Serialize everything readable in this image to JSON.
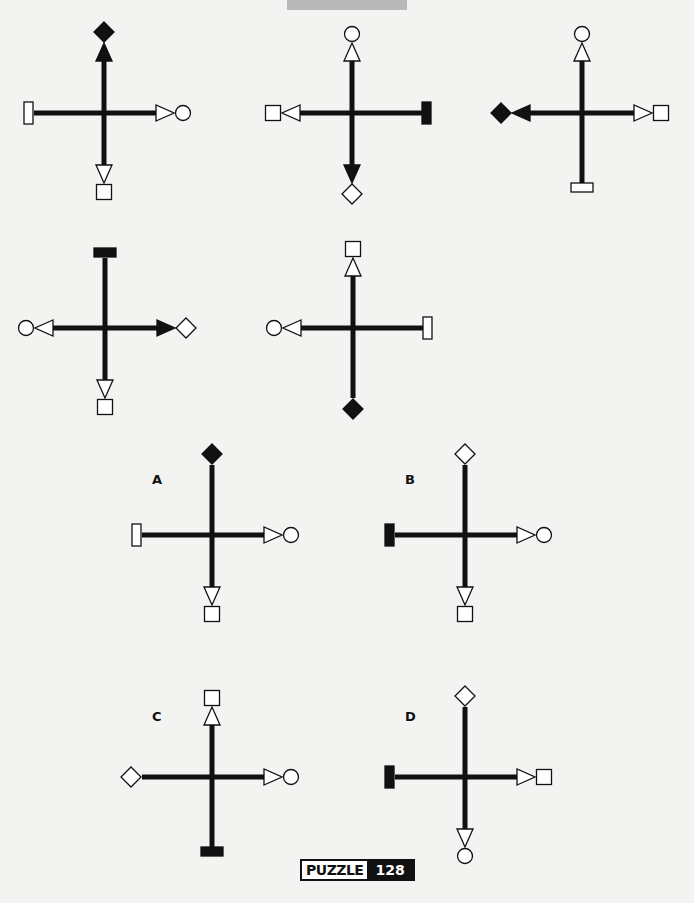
{
  "colors": {
    "background": "#f3f3f1",
    "ink": "#111111",
    "fill_white": "#ffffff",
    "top_bar": "#b9b9b9"
  },
  "puzzle": {
    "label": "PUZZLE",
    "number": "128"
  },
  "sequence": [
    {
      "id": "seq-1",
      "cx": 104,
      "cy": 113,
      "up": {
        "arrow": "filled",
        "end": "filled-diamond"
      },
      "right": {
        "arrow": "open",
        "end": "open-circle"
      },
      "down": {
        "arrow": "open",
        "end": "open-square"
      },
      "left": {
        "arrow": "none",
        "end": "open-bar"
      }
    },
    {
      "id": "seq-2",
      "cx": 352,
      "cy": 113,
      "up": {
        "arrow": "open",
        "end": "open-circle"
      },
      "right": {
        "arrow": "none",
        "end": "filled-bar"
      },
      "down": {
        "arrow": "filled",
        "end": "open-diamond"
      },
      "left": {
        "arrow": "open",
        "end": "open-square"
      }
    },
    {
      "id": "seq-3",
      "cx": 582,
      "cy": 113,
      "up": {
        "arrow": "open",
        "end": "open-circle"
      },
      "right": {
        "arrow": "open",
        "end": "open-square"
      },
      "down": {
        "arrow": "none",
        "end": "open-bar"
      },
      "left": {
        "arrow": "filled",
        "end": "filled-diamond"
      }
    },
    {
      "id": "seq-4",
      "cx": 105,
      "cy": 328,
      "up": {
        "arrow": "none",
        "end": "filled-bar"
      },
      "right": {
        "arrow": "filled",
        "end": "open-diamond"
      },
      "down": {
        "arrow": "open",
        "end": "open-square"
      },
      "left": {
        "arrow": "open",
        "end": "open-circle"
      }
    },
    {
      "id": "seq-5",
      "cx": 353,
      "cy": 328,
      "up": {
        "arrow": "open",
        "end": "open-square"
      },
      "right": {
        "arrow": "none",
        "end": "open-bar"
      },
      "down": {
        "arrow": "none",
        "end": "filled-diamond"
      },
      "left": {
        "arrow": "open",
        "end": "open-circle"
      }
    }
  ],
  "options": [
    {
      "label": "A",
      "cx": 212,
      "cy": 535,
      "label_x": 152,
      "label_y": 472,
      "up": {
        "arrow": "none",
        "end": "filled-diamond"
      },
      "right": {
        "arrow": "open",
        "end": "open-circle"
      },
      "down": {
        "arrow": "open",
        "end": "open-square"
      },
      "left": {
        "arrow": "none",
        "end": "open-bar"
      }
    },
    {
      "label": "B",
      "cx": 465,
      "cy": 535,
      "label_x": 405,
      "label_y": 472,
      "up": {
        "arrow": "none",
        "end": "open-diamond"
      },
      "right": {
        "arrow": "open",
        "end": "open-circle"
      },
      "down": {
        "arrow": "open",
        "end": "open-square"
      },
      "left": {
        "arrow": "none",
        "end": "filled-bar"
      }
    },
    {
      "label": "C",
      "cx": 212,
      "cy": 777,
      "label_x": 152,
      "label_y": 709,
      "up": {
        "arrow": "open",
        "end": "open-square"
      },
      "right": {
        "arrow": "open",
        "end": "open-circle"
      },
      "down": {
        "arrow": "none",
        "end": "filled-bar"
      },
      "left": {
        "arrow": "none",
        "end": "open-diamond"
      }
    },
    {
      "label": "D",
      "cx": 465,
      "cy": 777,
      "label_x": 405,
      "label_y": 709,
      "up": {
        "arrow": "none",
        "end": "open-diamond"
      },
      "right": {
        "arrow": "open",
        "end": "open-square"
      },
      "down": {
        "arrow": "open",
        "end": "open-circle"
      },
      "left": {
        "arrow": "none",
        "end": "filled-bar"
      }
    }
  ]
}
